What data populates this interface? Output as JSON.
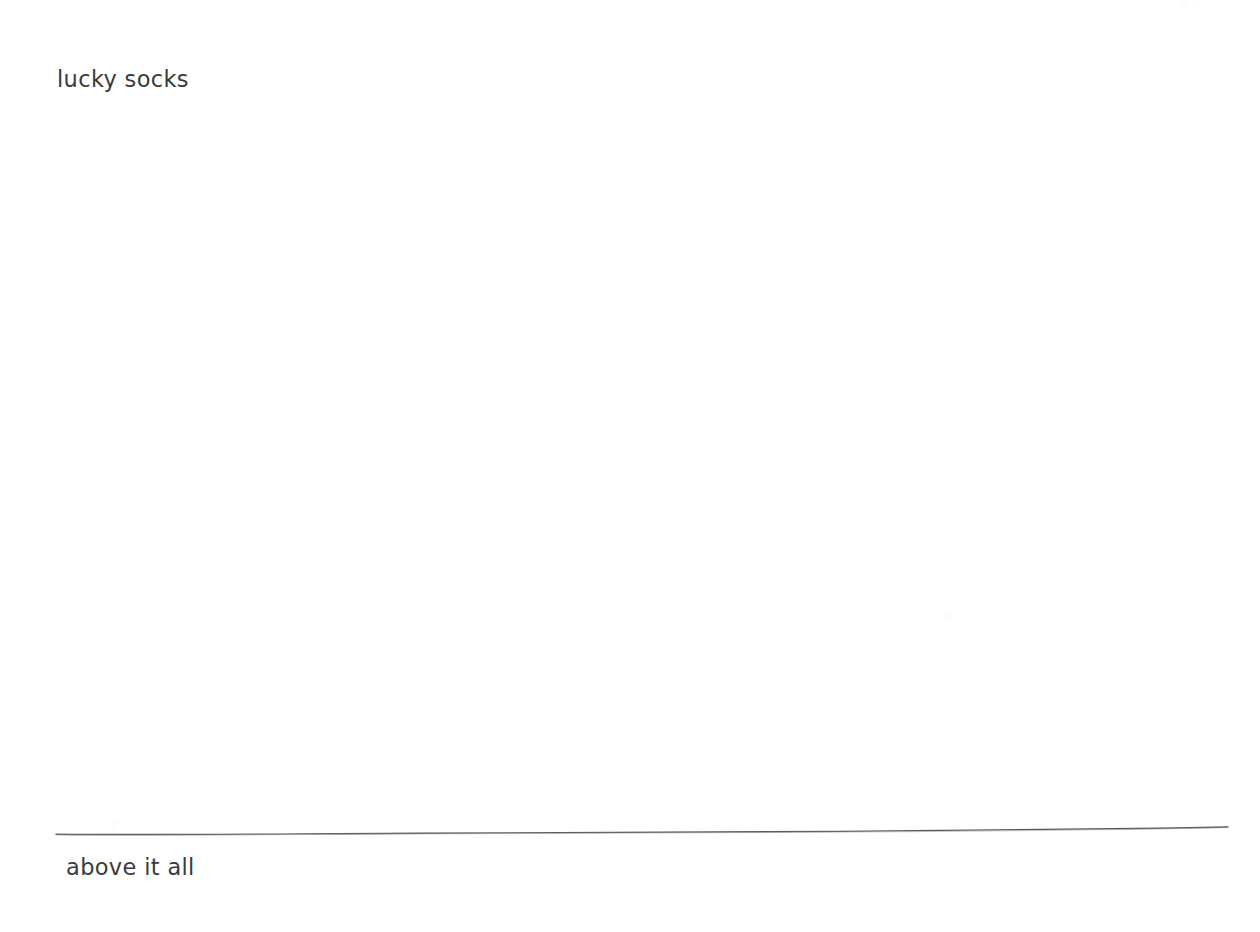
{
  "page": {
    "background_color": "#ffffff",
    "width": 1260,
    "height": 932,
    "kind": "scanned-note"
  },
  "content": {
    "top_phrase": "lucky socks",
    "bottom_phrase": "above it all",
    "text_color": "#3b3b3b"
  },
  "divider": {
    "name": "hand-drawn-horizontal-rule",
    "color": "#5a5a5a",
    "stroke_width": 1.4,
    "start_x": 56,
    "start_y": 834,
    "end_x": 1228,
    "end_y": 827,
    "style": "slightly-wavy-hand-drawn"
  },
  "artifacts": {
    "speck_color": "#fcfcfc",
    "note": "faint scan speckles"
  }
}
